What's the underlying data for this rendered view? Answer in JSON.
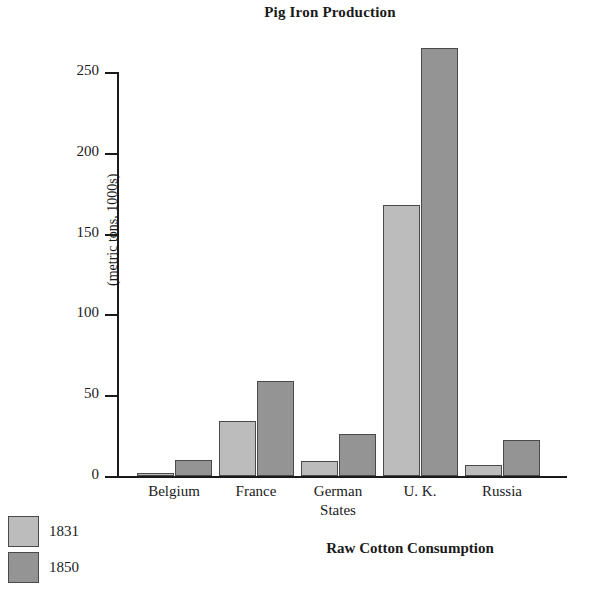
{
  "chart_data": {
    "type": "bar",
    "title": "Pig Iron Production",
    "xlabel": "",
    "ylabel": "(metric tons, 1000s)",
    "ylim": [
      0,
      265
    ],
    "yticks": [
      0,
      50,
      100,
      150,
      200,
      250
    ],
    "ytick_labels": [
      "0",
      "50",
      "100",
      "150",
      "200",
      "250"
    ],
    "grid": false,
    "legend_position": "bottom-left",
    "categories": [
      "Belgium",
      "France",
      "German States",
      "U. K.",
      "Russia"
    ],
    "category_labels": [
      {
        "line1": "Belgium",
        "line2": ""
      },
      {
        "line1": "France",
        "line2": ""
      },
      {
        "line1": "German",
        "line2": "States"
      },
      {
        "line1": "U. K.",
        "line2": ""
      },
      {
        "line1": "Russia",
        "line2": ""
      }
    ],
    "series": [
      {
        "name": "1831",
        "color": "#bcbcbc",
        "values": [
          2,
          34,
          9,
          168,
          7
        ]
      },
      {
        "name": "1850",
        "color": "#949494",
        "values": [
          10,
          59,
          26,
          265,
          22
        ]
      }
    ]
  },
  "legend": {
    "items": [
      {
        "label": "1831",
        "color": "#bcbcbc"
      },
      {
        "label": "1850",
        "color": "#949494"
      }
    ]
  },
  "next_section": {
    "title": "Raw Cotton Consumption"
  }
}
